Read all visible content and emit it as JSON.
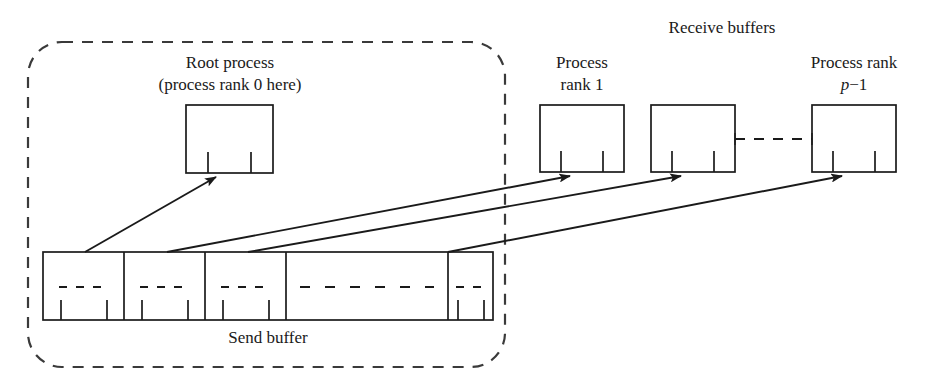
{
  "figure": {
    "labels": {
      "receive_buffers": "Receive buffers",
      "root_process_line1": "Root process",
      "root_process_line2": "(process rank 0 here)",
      "process_rank_1_line1": "Process",
      "process_rank_1_line2": "rank 1",
      "process_rank_p_line1": "Process rank",
      "process_rank_p_var": "p",
      "process_rank_p_rest": "−1",
      "send_buffer": "Send buffer"
    },
    "colors": {
      "stroke": "#1a1a1a",
      "background": "#ffffff",
      "dashed_group": "#3a3a3a"
    },
    "group_box": {
      "name": "root-process-group",
      "style": "dashed rounded rectangle"
    },
    "root_box": {
      "name": "root-process-buffer",
      "ticks": 2
    },
    "receive_boxes": [
      {
        "name": "receive-buffer-rank-1",
        "ticks": 2
      },
      {
        "name": "receive-buffer-middle",
        "ticks": 2
      },
      {
        "name": "receive-buffer-rank-p-minus-1",
        "ticks": 2
      }
    ],
    "ellipsis_connector": {
      "name": "receive-buffer-ellipsis",
      "style": "dashed"
    },
    "send_buffer": {
      "name": "send-buffer",
      "cells": [
        {
          "name": "send-buffer-cell-0",
          "ticks": 2,
          "dashes": 3
        },
        {
          "name": "send-buffer-cell-1",
          "ticks": 2,
          "dashes": 3
        },
        {
          "name": "send-buffer-cell-2",
          "ticks": 2,
          "dashes": 3
        },
        {
          "name": "send-buffer-cell-ellipsis",
          "ticks": 0,
          "dashes": 5
        },
        {
          "name": "send-buffer-cell-last",
          "ticks": 2,
          "dashes": 3
        }
      ]
    },
    "arrows": [
      {
        "name": "arrow-to-root-process",
        "from": "send-buffer-cell-0",
        "to": "root-process-buffer"
      },
      {
        "name": "arrow-to-rank-1",
        "from": "send-buffer-cell-1",
        "to": "receive-buffer-rank-1"
      },
      {
        "name": "arrow-to-middle",
        "from": "send-buffer-cell-2",
        "to": "receive-buffer-middle"
      },
      {
        "name": "arrow-to-rank-p-minus-1",
        "from": "send-buffer-cell-last",
        "to": "receive-buffer-rank-p-minus-1"
      }
    ]
  }
}
